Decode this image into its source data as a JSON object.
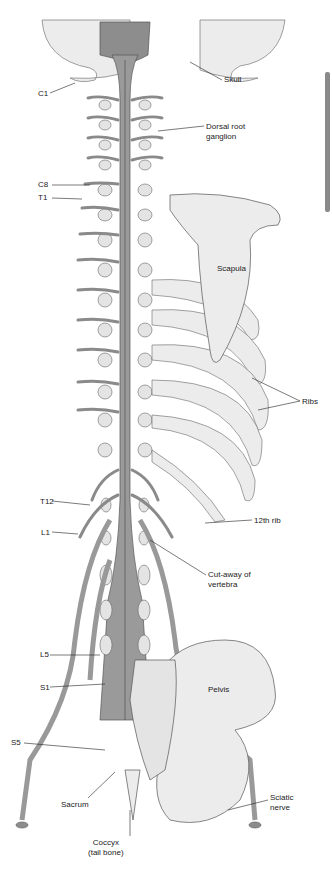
{
  "figure": {
    "colors": {
      "cord": "#9a9a9a",
      "bone": "#e8e8e8",
      "outline": "#555555",
      "side_bar": "#8a8a8a"
    }
  },
  "labels": {
    "skull": "Skull",
    "c1": "C1",
    "dorsal_root_ganglion": "Dorsal root\nganglion",
    "c8": "C8",
    "t1": "T1",
    "scapula": "Scapula",
    "ribs": "Ribs",
    "t12": "T12",
    "rib12": "12th rib",
    "l1": "L1",
    "cutaway": "Cut-away of\nvertebra",
    "l5": "L5",
    "s1": "S1",
    "pelvis": "Pelvis",
    "s5": "S5",
    "sacrum": "Sacrum",
    "sciatic": "Sciatic\nnerve",
    "coccyx": "Coccyx\n(tail bone)"
  }
}
